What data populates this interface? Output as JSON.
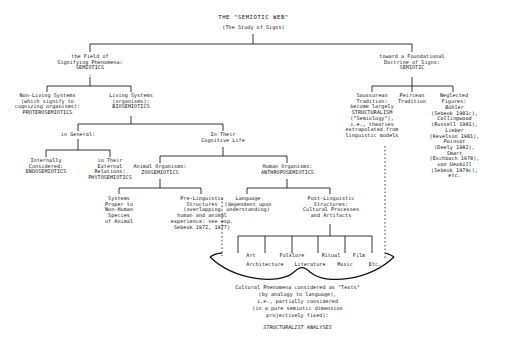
{
  "title": {
    "main": "THE \"SEMIOTIC WEB\"",
    "sub": "(The Study of Signs)"
  },
  "branches": {
    "left": {
      "l1": "the Field of\nSignifying Phenomena:\nSEMIOTICS",
      "nonliving": "Non-Living Systems\n(which signify to\ncognizing organisms):\nPROTEROSEMIOTICS",
      "living": "Living Systems\n(organisms):\nBIOSEMIOTICS",
      "in_general": "in General:",
      "internally": "Internally\nConsidered:\nENDOSEMIOTICS",
      "external": "in Their\nExternal\nRelations:\nPHYTOSEMIOTICS",
      "cognitive": "In Their\nCognitive Life",
      "animal": "Animal Organisms:\nZOOSEMIOTICS",
      "human": "Human Organisms:\nANTHROPOSEMIOTICS",
      "systems_proper": "Systems\nProper to\nNon-Human\nSpecies\nof Animal",
      "prelinguistic": "Pre-Linguistic\nStructures\n(overlapping\nhuman and animal\nexperience: see esp.\nSebeok 1972, 1977)",
      "language": "Language\n(dependent upon\nunderstanding)",
      "postlinguistic": "Post-Linguistic\nStructures:\nCultural Processes\nand Artifacts"
    },
    "right": {
      "l1": "toward a Foundational\nDoctrine of Signs:\nSEMIOTIC",
      "saussure": "Saussurean\nTradition:\nbecome largely\nSTRUCTURALISM\n(\"Semiology\"),\ni.e., theories\nextrapolated from\nlinguistic models",
      "peirce": "Peircean\nTradition",
      "neglected_head": "Neglected\nFigures:",
      "neglected_list": [
        {
          "name": "Bühler",
          "ref": "(Sebeok 1981c),"
        },
        {
          "name": "Collingwood",
          "ref": "(Russell 1981),"
        },
        {
          "name": "Lieber",
          "ref": "(Kevelson 1981),"
        },
        {
          "name": "Poinsot",
          "ref": "(Deely 1982),"
        },
        {
          "name": "Smart",
          "ref": "(Eschbach 1978),"
        },
        {
          "name": "von Uexküll",
          "ref": "(Sebeok 1979c),"
        },
        {
          "name": "etc.",
          "ref": ""
        }
      ]
    }
  },
  "cultural_items": {
    "top_row": [
      "Art",
      "Folklore",
      "Ritual",
      "Film"
    ],
    "bottom_row": [
      "Architecture",
      "Literature",
      "Music",
      "Etc."
    ]
  },
  "conclusion": {
    "line1": "Cultural Phenomena considered as \"Texts\"",
    "line2": "(by analogy to language),",
    "line3": "i.e., partially considered",
    "line4": "(in a pure semiotic dimension",
    "line5": "projectively fixed):",
    "emphasis": "STRUCTURALIST ANALYSES"
  }
}
